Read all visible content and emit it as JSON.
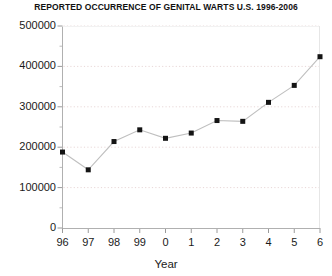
{
  "chart_data": {
    "type": "line",
    "title": "REPORTED OCCURRENCE OF GENITAL WARTS U.S. 1996-2006",
    "xlabel": "Year",
    "ylabel": "",
    "categories": [
      "96",
      "97",
      "98",
      "99",
      "0",
      "1",
      "2",
      "3",
      "4",
      "5",
      "6"
    ],
    "x_full_years": [
      1996,
      1997,
      1998,
      1999,
      2000,
      2001,
      2002,
      2003,
      2004,
      2005,
      2006
    ],
    "values": [
      188000,
      144000,
      214000,
      243000,
      222000,
      235000,
      266000,
      264000,
      311000,
      353000,
      424000
    ],
    "ylim": [
      0,
      500000
    ],
    "ytick_labels": [
      "0",
      "100000",
      "200000",
      "300000",
      "400000",
      "500000"
    ],
    "ytick_values": [
      0,
      100000,
      200000,
      300000,
      400000,
      500000
    ],
    "yminor_interval": 50000,
    "grid": true,
    "grid_color": "#e8d7d7",
    "legend": "none",
    "marker": "square",
    "marker_color": "#141414",
    "line_color": "#bfbfbf",
    "axis_color": "#b5b5b5"
  }
}
